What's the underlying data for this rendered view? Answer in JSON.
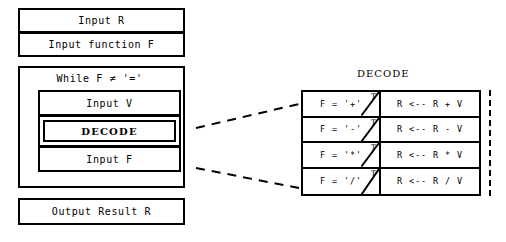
{
  "diagram": {
    "type": "nassi-shneiderman-structogram",
    "left_flowchart": {
      "blocks": [
        {
          "name": "input-r",
          "label": "Input R"
        },
        {
          "name": "input-function-f",
          "label": "Input function F"
        }
      ],
      "loop": {
        "condition_label": "While F ≠ '='",
        "body": [
          {
            "name": "input-v",
            "label": "Input V"
          },
          {
            "name": "decode",
            "label": "DECODE",
            "kind": "subroutine-call"
          },
          {
            "name": "input-f",
            "label": "Input F"
          }
        ]
      },
      "output": {
        "name": "output-result-r",
        "label": "Output Result R"
      }
    },
    "decode_detail": {
      "title": "DECODE",
      "branch_marker": "T",
      "rows": [
        {
          "condition": "F = '+'",
          "marker": "T",
          "action": "R <-- R + V"
        },
        {
          "condition": "F = '-'",
          "marker": "T",
          "action": "R <-- R - V"
        },
        {
          "condition": "F = '*'",
          "marker": "T",
          "action": "R <-- R * V"
        },
        {
          "condition": "F = '/'",
          "marker": "T",
          "action": "R <-- R / V"
        }
      ]
    },
    "colors": {
      "stroke": "#000000",
      "background": "#ffffff"
    }
  }
}
